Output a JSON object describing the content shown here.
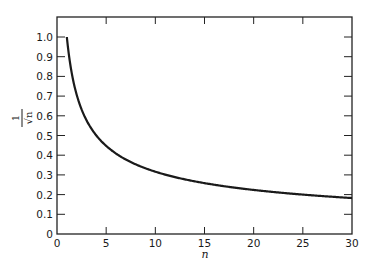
{
  "chart_data": {
    "type": "line",
    "title": "",
    "xlabel": "n",
    "ylabel": "1/√n",
    "ylabel_numerator": "1",
    "ylabel_denominator": "√n",
    "xlim": [
      0,
      30
    ],
    "ylim": [
      0,
      1.0
    ],
    "xticks": [
      0,
      5,
      10,
      15,
      20,
      25,
      30
    ],
    "yticks": [
      0,
      0.1,
      0.2,
      0.3,
      0.4,
      0.5,
      0.6,
      0.7,
      0.8,
      0.9,
      1.0
    ],
    "xtick_labels": [
      "0",
      "5",
      "10",
      "15",
      "20",
      "25",
      "30"
    ],
    "ytick_labels": [
      "0",
      "0.1",
      "0.2",
      "0.3",
      "0.4",
      "0.5",
      "0.6",
      "0.7",
      "0.8",
      "0.9",
      "1.0"
    ],
    "grid": false,
    "legend": null,
    "series": [
      {
        "name": "1/√n",
        "function": "1/sqrt(n)",
        "x": [
          1,
          2,
          3,
          4,
          5,
          6,
          7,
          8,
          9,
          10,
          12,
          15,
          20,
          25,
          30
        ],
        "values": [
          1.0,
          0.707,
          0.577,
          0.5,
          0.447,
          0.408,
          0.378,
          0.354,
          0.333,
          0.316,
          0.289,
          0.258,
          0.224,
          0.2,
          0.183
        ],
        "color": "#1a1a1a"
      }
    ]
  },
  "colors": {
    "line": "#1a1a1a",
    "axis": "#222222",
    "background": "#ffffff"
  }
}
